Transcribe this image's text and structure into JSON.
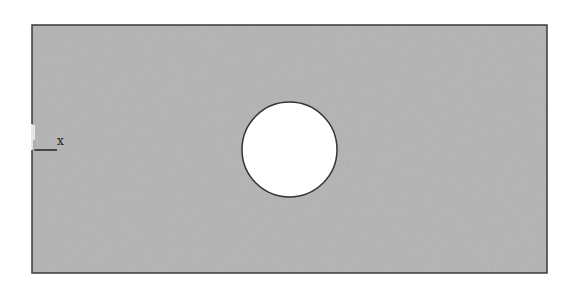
{
  "diagram": {
    "type": "plate-with-hole",
    "canvas": {
      "width": 570,
      "height": 290,
      "background": "#ffffff"
    },
    "plate": {
      "x": 32,
      "y": 25,
      "width": 515,
      "height": 248,
      "fill": "#b3b3b3",
      "stroke": "#3a3a3a",
      "stroke_width": 1.5,
      "left_edge_gap": {
        "y_start": 124,
        "y_end": 150
      }
    },
    "hole": {
      "cx": 289.5,
      "cy": 149.5,
      "r": 47.5,
      "fill": "#ffffff",
      "stroke": "#333333",
      "stroke_width": 1.5
    },
    "axis": {
      "origin_x": 34,
      "origin_y": 150,
      "x_axis_length": 23,
      "y_axis_length": 10,
      "color": "#222222",
      "label": "x",
      "label_x": 57,
      "label_y": 135
    }
  }
}
